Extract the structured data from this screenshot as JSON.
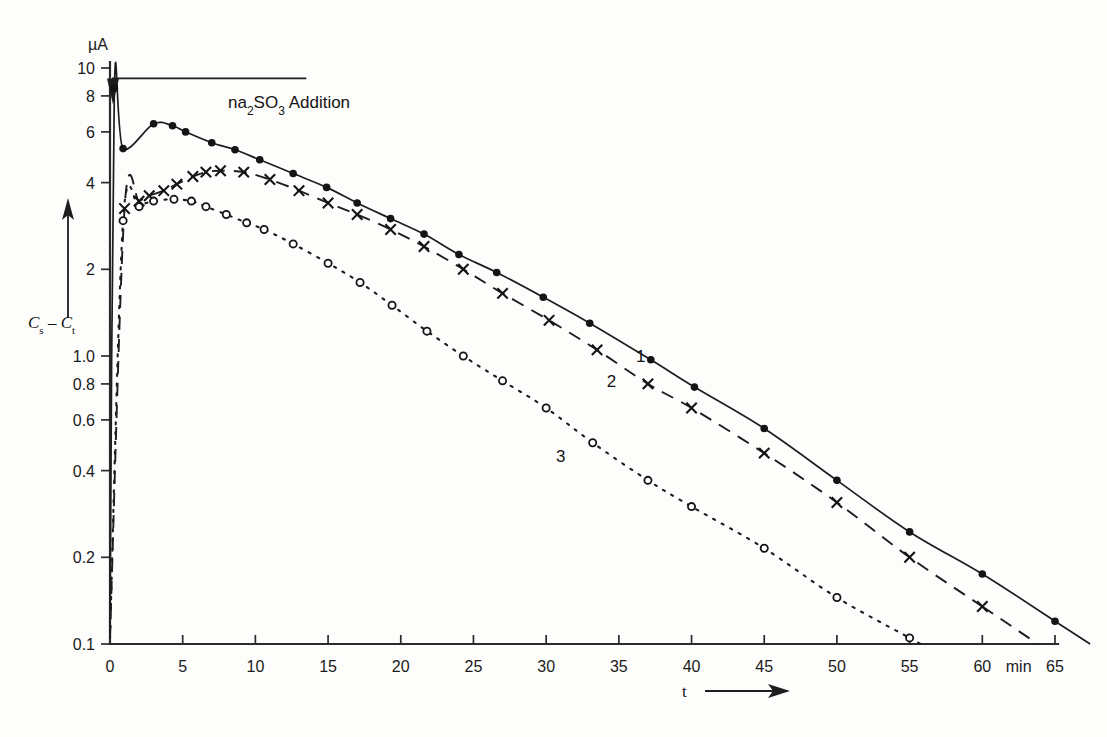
{
  "figure": {
    "background_color": "#fdfdfc",
    "ink_color": "#1a1a1a"
  },
  "labels": {
    "y_unit": "µA",
    "y_axis_title_main": "C",
    "y_axis_title_sub1": "s",
    "y_axis_title_dash": "–",
    "y_axis_title_main2": "C",
    "y_axis_title_sub2": "t",
    "x_axis_title": "t",
    "x_unit": "min",
    "annotation": "na",
    "annotation_sub": "2",
    "annotation_mid": "SO",
    "annotation_sub2": "3",
    "annotation_end": " Addition",
    "curve1": "1",
    "curve2": "2",
    "curve3": "3"
  },
  "axes": {
    "y_tick_labels": [
      "10",
      "8",
      "6",
      "4",
      "2",
      "1.0",
      "0.8",
      "0.6",
      "0.4",
      "0.2",
      "0.1"
    ],
    "y_tick_values": [
      10,
      8,
      6,
      4,
      2,
      1.0,
      0.8,
      0.6,
      0.4,
      0.2,
      0.1
    ],
    "x_tick_labels": [
      "0",
      "5",
      "10",
      "15",
      "20",
      "25",
      "30",
      "35",
      "40",
      "45",
      "50",
      "55",
      "60",
      "65"
    ],
    "x_tick_values": [
      0,
      5,
      10,
      15,
      20,
      25,
      30,
      35,
      40,
      45,
      50,
      55,
      60,
      65
    ]
  },
  "chart_data": {
    "type": "line",
    "title": "",
    "subtitle": "",
    "xlabel": "t",
    "ylabel": "Cs – Ct",
    "x_unit": "min",
    "y_unit": "µA",
    "yscale": "log",
    "xscale": "linear",
    "xlim": [
      0,
      65
    ],
    "ylim": [
      0.1,
      10
    ],
    "grid": false,
    "legend_position": "inline-curve-labels",
    "annotations": [
      {
        "text": "na2SO3 Addition",
        "x": 13,
        "y": 9.2,
        "note": "horizontal guide line drawn at y≈9.2 from t=0 to t≈13.5 with downward arrow marker at t=0"
      }
    ],
    "series": [
      {
        "name": "1",
        "marker": "filled-circle",
        "linestyle": "solid",
        "label_position": {
          "x": 36.5,
          "y": 0.95
        },
        "points": [
          {
            "x": 0.0,
            "y": 0.105
          },
          {
            "x": 0.3,
            "y": 8.5
          },
          {
            "x": 0.9,
            "y": 5.25
          },
          {
            "x": 3.0,
            "y": 6.4
          },
          {
            "x": 4.3,
            "y": 6.3
          },
          {
            "x": 5.2,
            "y": 6.0
          },
          {
            "x": 7.0,
            "y": 5.5
          },
          {
            "x": 8.6,
            "y": 5.2
          },
          {
            "x": 10.3,
            "y": 4.8
          },
          {
            "x": 12.6,
            "y": 4.3
          },
          {
            "x": 14.9,
            "y": 3.85
          },
          {
            "x": 17.0,
            "y": 3.4
          },
          {
            "x": 19.3,
            "y": 3.0
          },
          {
            "x": 21.6,
            "y": 2.65
          },
          {
            "x": 24.0,
            "y": 2.25
          },
          {
            "x": 26.6,
            "y": 1.95
          },
          {
            "x": 29.8,
            "y": 1.6
          },
          {
            "x": 33.0,
            "y": 1.3
          },
          {
            "x": 37.2,
            "y": 0.97
          },
          {
            "x": 40.2,
            "y": 0.78
          },
          {
            "x": 45.0,
            "y": 0.56
          },
          {
            "x": 50.0,
            "y": 0.37
          },
          {
            "x": 55.0,
            "y": 0.245
          },
          {
            "x": 60.0,
            "y": 0.175
          },
          {
            "x": 65.0,
            "y": 0.12
          }
        ]
      },
      {
        "name": "2",
        "marker": "cross",
        "linestyle": "dashed",
        "label_position": {
          "x": 34.5,
          "y": 0.78
        },
        "points": [
          {
            "x": 0.0,
            "y": 0.105
          },
          {
            "x": 1.0,
            "y": 3.25
          },
          {
            "x": 2.0,
            "y": 3.45
          },
          {
            "x": 2.7,
            "y": 3.6
          },
          {
            "x": 3.7,
            "y": 3.75
          },
          {
            "x": 4.6,
            "y": 3.95
          },
          {
            "x": 5.7,
            "y": 4.2
          },
          {
            "x": 6.6,
            "y": 4.35
          },
          {
            "x": 7.6,
            "y": 4.4
          },
          {
            "x": 9.2,
            "y": 4.35
          },
          {
            "x": 11.0,
            "y": 4.1
          },
          {
            "x": 13.0,
            "y": 3.75
          },
          {
            "x": 15.0,
            "y": 3.4
          },
          {
            "x": 17.0,
            "y": 3.1
          },
          {
            "x": 19.3,
            "y": 2.75
          },
          {
            "x": 21.6,
            "y": 2.4
          },
          {
            "x": 24.3,
            "y": 2.0
          },
          {
            "x": 27.0,
            "y": 1.65
          },
          {
            "x": 30.2,
            "y": 1.33
          },
          {
            "x": 33.5,
            "y": 1.05
          },
          {
            "x": 37.0,
            "y": 0.8
          },
          {
            "x": 40.0,
            "y": 0.66
          },
          {
            "x": 45.0,
            "y": 0.46
          },
          {
            "x": 50.0,
            "y": 0.31
          },
          {
            "x": 55.0,
            "y": 0.2
          },
          {
            "x": 60.0,
            "y": 0.135
          }
        ]
      },
      {
        "name": "3",
        "marker": "open-circle",
        "linestyle": "dotted",
        "label_position": {
          "x": 31.0,
          "y": 0.43
        },
        "points": [
          {
            "x": 0.0,
            "y": 0.105
          },
          {
            "x": 0.9,
            "y": 2.95
          },
          {
            "x": 2.0,
            "y": 3.3
          },
          {
            "x": 3.0,
            "y": 3.45
          },
          {
            "x": 4.4,
            "y": 3.5
          },
          {
            "x": 5.6,
            "y": 3.45
          },
          {
            "x": 6.6,
            "y": 3.3
          },
          {
            "x": 8.0,
            "y": 3.1
          },
          {
            "x": 9.4,
            "y": 2.9
          },
          {
            "x": 10.6,
            "y": 2.75
          },
          {
            "x": 12.6,
            "y": 2.45
          },
          {
            "x": 15.0,
            "y": 2.1
          },
          {
            "x": 17.2,
            "y": 1.8
          },
          {
            "x": 19.4,
            "y": 1.5
          },
          {
            "x": 21.8,
            "y": 1.22
          },
          {
            "x": 24.3,
            "y": 1.0
          },
          {
            "x": 27.0,
            "y": 0.82
          },
          {
            "x": 30.0,
            "y": 0.66
          },
          {
            "x": 33.2,
            "y": 0.5
          },
          {
            "x": 37.0,
            "y": 0.37
          },
          {
            "x": 40.0,
            "y": 0.3
          },
          {
            "x": 45.0,
            "y": 0.215
          },
          {
            "x": 50.0,
            "y": 0.145
          },
          {
            "x": 55.0,
            "y": 0.105
          }
        ]
      }
    ]
  }
}
